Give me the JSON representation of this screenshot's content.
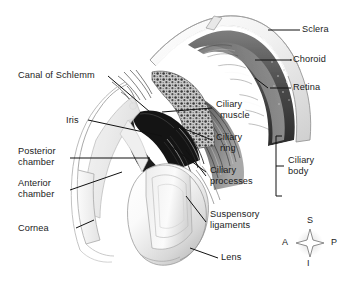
{
  "figure": {
    "background": "#ffffff",
    "text_color": "#1b1b1b"
  },
  "labels": {
    "sclera": "Sclera",
    "choroid": "Choroid",
    "retina": "Retina",
    "canal_of_schlemm": "Canal of Schlemm",
    "iris": "Iris",
    "posterior_chamber_1": "Posterior",
    "posterior_chamber_2": "chamber",
    "anterior_chamber_1": "Anterior",
    "anterior_chamber_2": "chamber",
    "cornea": "Cornea",
    "ciliary_muscle_1": "Ciliary",
    "ciliary_muscle_2": "muscle",
    "ciliary_ring_1": "Ciliary",
    "ciliary_ring_2": "ring",
    "ciliary_processes_1": "Ciliary",
    "ciliary_processes_2": "processes",
    "suspensory_1": "Suspensory",
    "suspensory_2": "ligaments",
    "lens": "Lens",
    "ciliary_body_1": "Ciliary",
    "ciliary_body_2": "body"
  },
  "compass": {
    "superior": "S",
    "inferior": "I",
    "anterior": "A",
    "posterior": "P"
  },
  "structures": [
    {
      "name": "sclera",
      "description": "outer white fibrous coat, pale cut band along outer curve"
    },
    {
      "name": "choroid",
      "description": "dark vascular layer beneath sclera"
    },
    {
      "name": "retina",
      "description": "innermost dark layer at posterior wall"
    },
    {
      "name": "ciliary-muscle",
      "description": "stippled meridional muscle mass"
    },
    {
      "name": "ciliary-ring",
      "description": "banded striations posterior to processes"
    },
    {
      "name": "ciliary-processes",
      "description": "radial folds projecting inward"
    },
    {
      "name": "iris",
      "description": "dark wedge anterior to lens"
    },
    {
      "name": "lens",
      "description": "large pale biconvex body, cut face visible"
    },
    {
      "name": "cornea",
      "description": "thin transparent anterior arcs"
    },
    {
      "name": "anterior-chamber",
      "description": "space between cornea and iris"
    },
    {
      "name": "posterior-chamber",
      "description": "space between iris and lens"
    },
    {
      "name": "suspensory-ligaments",
      "description": "fine zonular fibers to lens equator"
    },
    {
      "name": "canal-of-schlemm",
      "description": "small channel at iridocorneal angle"
    }
  ]
}
